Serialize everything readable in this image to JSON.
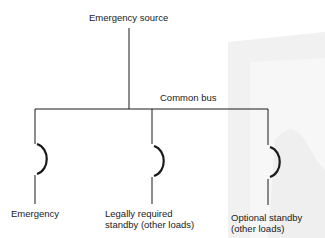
{
  "diagram": {
    "source_label": "Emergency source",
    "bus_label": "Common bus",
    "branches": [
      {
        "label": "Emergency"
      },
      {
        "label": "Legally required\nstandby (other loads)"
      },
      {
        "label": "Optional standby\n(other loads)"
      }
    ]
  },
  "colors": {
    "line": "#1a1a1a",
    "watermark": "#f0f0f0"
  }
}
